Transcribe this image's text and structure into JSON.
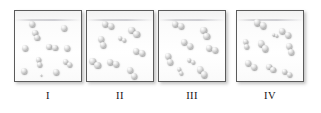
{
  "figure": {
    "kind": "molecular-representation-panels",
    "panel_count": 4,
    "atom_color": "#c9c9c9",
    "border_color": "#5b5b5b",
    "background_color": "#ffffff"
  },
  "panels": [
    {
      "id": "panel-1",
      "label": "I",
      "x": 14,
      "y": 10,
      "w": 68,
      "h": 72,
      "label_x": 14,
      "label_w": 68,
      "composition": "mixture of single atoms and diatomic molecules",
      "single_atom_count": 7,
      "diatomic_count": 4,
      "particles": [
        {
          "type": "atom",
          "cx": 17,
          "cy": 13,
          "r": 3.4
        },
        {
          "type": "atom",
          "cx": 49,
          "cy": 17,
          "r": 3.4
        },
        {
          "type": "atom",
          "cx": 10,
          "cy": 37,
          "r": 3.4
        },
        {
          "type": "atom",
          "cx": 52,
          "cy": 37,
          "r": 3.4
        },
        {
          "type": "atom",
          "cx": 9,
          "cy": 60,
          "r": 3.4
        },
        {
          "type": "atom",
          "cx": 41,
          "cy": 61,
          "r": 3.4
        },
        {
          "type": "atom",
          "cx": 26,
          "cy": 64,
          "r": 1.0
        },
        {
          "type": "diatomic",
          "cx": 21,
          "cy": 24,
          "r": 2.6,
          "angle": 68
        },
        {
          "type": "diatomic",
          "cx": 37,
          "cy": 36,
          "r": 2.8,
          "angle": 8
        },
        {
          "type": "diatomic",
          "cx": 24,
          "cy": 51,
          "r": 2.5,
          "angle": 80
        },
        {
          "type": "diatomic",
          "cx": 52,
          "cy": 52,
          "r": 2.5,
          "angle": 40
        }
      ]
    },
    {
      "id": "panel-2",
      "label": "II",
      "x": 86,
      "y": 10,
      "w": 68,
      "h": 72,
      "label_x": 86,
      "label_w": 68,
      "composition": "all diatomic molecules",
      "single_atom_count": 0,
      "diatomic_count": 8,
      "particles": [
        {
          "type": "diatomic",
          "cx": 21,
          "cy": 14,
          "r": 3.1,
          "angle": 22
        },
        {
          "type": "diatomic",
          "cx": 47,
          "cy": 21,
          "r": 3.1,
          "angle": 42
        },
        {
          "type": "diatomic",
          "cx": 15,
          "cy": 31,
          "r": 3.1,
          "angle": 72
        },
        {
          "type": "diatomic",
          "cx": 52,
          "cy": 41,
          "r": 3.1,
          "angle": 18
        },
        {
          "type": "diatomic",
          "cx": 8,
          "cy": 52,
          "r": 3.1,
          "angle": 38
        },
        {
          "type": "diatomic",
          "cx": 26,
          "cy": 52,
          "r": 3.1,
          "angle": 22
        },
        {
          "type": "diatomic",
          "cx": 45,
          "cy": 62,
          "r": 3.1,
          "angle": 58
        },
        {
          "type": "diatomic",
          "cx": 35,
          "cy": 28,
          "r": 2.2,
          "angle": 30
        }
      ]
    },
    {
      "id": "panel-3",
      "label": "III",
      "x": 158,
      "y": 10,
      "w": 68,
      "h": 72,
      "label_x": 158,
      "label_w": 68,
      "composition": "all diatomic molecules",
      "single_atom_count": 0,
      "diatomic_count": 8,
      "particles": [
        {
          "type": "diatomic",
          "cx": 19,
          "cy": 14,
          "r": 3.1,
          "angle": 12
        },
        {
          "type": "diatomic",
          "cx": 46,
          "cy": 22,
          "r": 3.1,
          "angle": 62
        },
        {
          "type": "diatomic",
          "cx": 28,
          "cy": 33,
          "r": 3.1,
          "angle": 30
        },
        {
          "type": "diatomic",
          "cx": 53,
          "cy": 38,
          "r": 3.1,
          "angle": 20
        },
        {
          "type": "diatomic",
          "cx": 10,
          "cy": 48,
          "r": 3.1,
          "angle": 78
        },
        {
          "type": "diatomic",
          "cx": 32,
          "cy": 50,
          "r": 2.3,
          "angle": 28
        },
        {
          "type": "diatomic",
          "cx": 43,
          "cy": 61,
          "r": 3.1,
          "angle": 48
        },
        {
          "type": "diatomic",
          "cx": 21,
          "cy": 60,
          "r": 2.2,
          "angle": 60
        }
      ]
    },
    {
      "id": "panel-4",
      "label": "IV",
      "x": 236,
      "y": 10,
      "w": 68,
      "h": 72,
      "label_x": 236,
      "label_w": 68,
      "composition": "all diatomic molecules",
      "single_atom_count": 0,
      "diatomic_count": 9,
      "particles": [
        {
          "type": "diatomic",
          "cx": 23,
          "cy": 13,
          "r": 3.1,
          "angle": 26
        },
        {
          "type": "diatomic",
          "cx": 48,
          "cy": 22,
          "r": 3.1,
          "angle": 34
        },
        {
          "type": "diatomic",
          "cx": 9,
          "cy": 33,
          "r": 2.6,
          "angle": 80
        },
        {
          "type": "diatomic",
          "cx": 26,
          "cy": 35,
          "r": 3.1,
          "angle": 50
        },
        {
          "type": "diatomic",
          "cx": 53,
          "cy": 38,
          "r": 3.1,
          "angle": 74
        },
        {
          "type": "diatomic",
          "cx": 14,
          "cy": 54,
          "r": 3.1,
          "angle": 36
        },
        {
          "type": "diatomic",
          "cx": 34,
          "cy": 57,
          "r": 2.6,
          "angle": 42
        },
        {
          "type": "diatomic",
          "cx": 50,
          "cy": 62,
          "r": 2.8,
          "angle": 28
        },
        {
          "type": "diatomic",
          "cx": 38,
          "cy": 24,
          "r": 1.6,
          "angle": 20
        }
      ]
    }
  ]
}
